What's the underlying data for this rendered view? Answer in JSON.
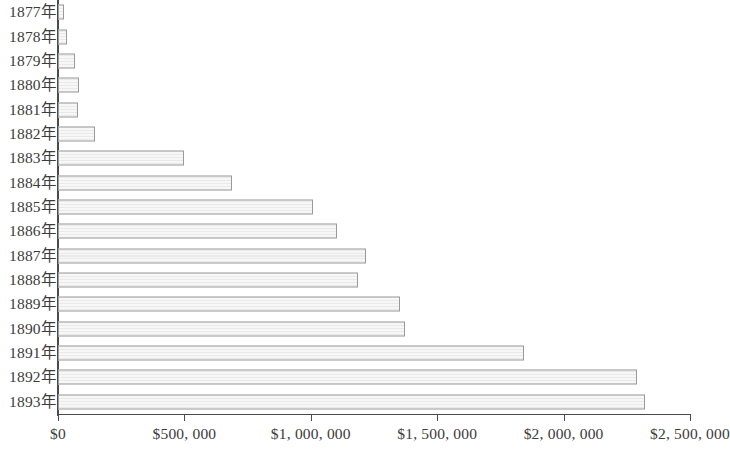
{
  "chart_data": {
    "type": "bar",
    "orientation": "horizontal",
    "title": "",
    "subtitle": "",
    "xlabel": "",
    "ylabel": "",
    "grid": false,
    "legend": null,
    "xlim": [
      0,
      2500000
    ],
    "x_tick_values": [
      0,
      500000,
      1000000,
      1500000,
      2000000,
      2500000
    ],
    "x_tick_labels": [
      "$0",
      "$500, 000",
      "$1, 000, 000",
      "$1, 500, 000",
      "$2, 000, 000",
      "$2, 500, 000"
    ],
    "categories": [
      "1877年",
      "1878年",
      "1879年",
      "1880年",
      "1881年",
      "1882年",
      "1883年",
      "1884年",
      "1885年",
      "1886年",
      "1887年",
      "1888年",
      "1889年",
      "1890年",
      "1891年",
      "1892年",
      "1893年"
    ],
    "values": [
      24000,
      36000,
      67000,
      83000,
      79000,
      146000,
      498000,
      688000,
      1009000,
      1104000,
      1218000,
      1187000,
      1353000,
      1373000,
      1843000,
      2290000,
      2322000
    ],
    "bar_fill_color": "#f7f7f7",
    "bar_border_color": "#9a9a9a",
    "axis_color": "#4a4a4a",
    "background_color": "#ffffff"
  }
}
